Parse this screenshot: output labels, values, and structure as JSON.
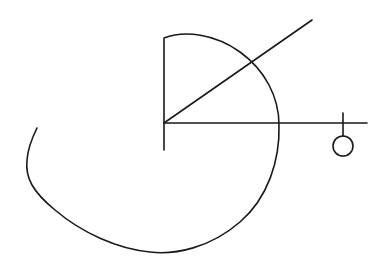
{
  "diagram": {
    "type": "geometric-line-drawing",
    "background": "#ffffff",
    "stroke_color": "#1a1a1a",
    "stroke_width": 1.6,
    "elements": {
      "vertical_axis": {
        "x1": 164,
        "y1": 39,
        "x2": 164,
        "y2": 150
      },
      "horizontal_axis": {
        "x1": 164,
        "y1": 123,
        "x2": 367,
        "y2": 123
      },
      "diagonal_ray": {
        "x1": 164,
        "y1": 123,
        "x2": 312,
        "y2": 20
      },
      "spiral_curve": "M164,38 C185,30 215,34 240,52 C265,70 279,97 279,125 C280,160 268,198 240,222 C210,248 175,255 150,252 C118,249 82,233 55,210 C33,192 25,178 27,160 C28,148 32,138 37,128",
      "end_marker_tick": {
        "x1": 343,
        "y1": 113,
        "x2": 343,
        "y2": 136
      },
      "end_marker_circle": {
        "cx": 343,
        "cy": 146,
        "r": 10
      }
    }
  }
}
